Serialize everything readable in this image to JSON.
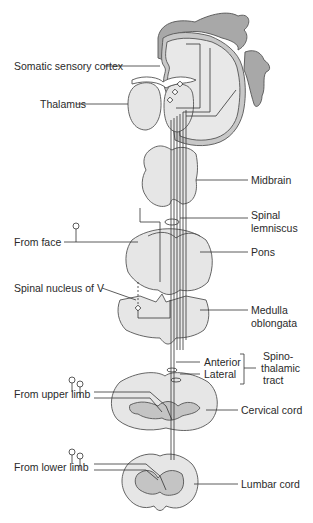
{
  "figure": {
    "colors": {
      "tissue_fill": "#e6e6e6",
      "tissue_stroke": "#555555",
      "cortex_fill": "#a8a8a8",
      "gray_matter": "#c4c4c4",
      "line": "#333333",
      "text": "#2a2a2a"
    },
    "labels": {
      "somatic_sensory_cortex": "Somatic sensory cortex",
      "thalamus": "Thalamus",
      "midbrain": "Midbrain",
      "spinal_lemniscus_1": "Spinal",
      "spinal_lemniscus_2": "lemniscus",
      "from_face": "From face",
      "pons": "Pons",
      "spinal_nucleus_v": "Spinal nucleus of V",
      "medulla_1": "Medulla",
      "medulla_2": "oblongata",
      "anterior": "Anterior",
      "lateral": "Lateral",
      "spino_1": "Spino-",
      "spino_2": "thalamic",
      "spino_3": "tract",
      "from_upper_limb": "From upper limb",
      "cervical_cord": "Cervical cord",
      "from_lower_limb": "From lower limb",
      "lumbar_cord": "Lumbar cord"
    }
  }
}
